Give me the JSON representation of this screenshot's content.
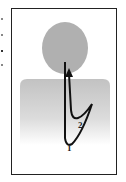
{
  "figure": {
    "labels": [
      {
        "id": "1",
        "text": "1"
      },
      {
        "id": "2",
        "text": "2"
      }
    ],
    "colors": {
      "frame": "#222222",
      "head": "#b3b3b3",
      "torso_top": "#c4c4c4",
      "torso_bottom": "#ffffff",
      "arrow": "#111111"
    }
  }
}
